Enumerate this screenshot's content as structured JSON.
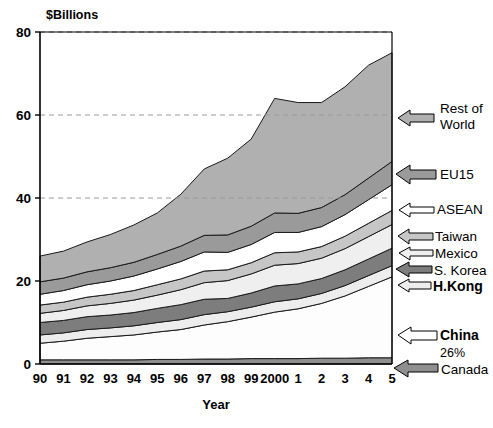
{
  "chart_data": {
    "type": "area",
    "stacked": true,
    "title": "",
    "subtitle": "",
    "unit_label": "$Billions",
    "xlabel": "Year",
    "ylabel": "",
    "ylim": [
      0,
      80
    ],
    "yticks": [
      0,
      20,
      40,
      60,
      80
    ],
    "grid": "horizontal-dashed-at-40-and-60",
    "legend_position": "right-arrow-callouts",
    "x": [
      "1990",
      "1991",
      "1992",
      "1993",
      "1994",
      "1995",
      "1996",
      "1997",
      "1998",
      "1999",
      "2000",
      "2001",
      "2002",
      "2003",
      "2004",
      "2005"
    ],
    "xtick_labels": [
      "90",
      "91",
      "92",
      "93",
      "94",
      "95",
      "96",
      "97",
      "98",
      "99",
      "2000",
      "1",
      "2",
      "3",
      "4",
      "5"
    ],
    "series": [
      {
        "name": "Canada",
        "label": "Canada",
        "color": "#8f8f8f",
        "arrow_style": "solid-gray",
        "values": [
          1.0,
          1.0,
          1.0,
          1.0,
          1.0,
          1.1,
          1.1,
          1.2,
          1.2,
          1.3,
          1.3,
          1.3,
          1.4,
          1.4,
          1.5,
          1.5
        ]
      },
      {
        "name": "China",
        "label": "China",
        "annotation": "26%",
        "color": "#fdfdfd",
        "arrow_style": "outline-white",
        "values": [
          4.0,
          4.5,
          5.2,
          5.6,
          6.0,
          6.6,
          7.2,
          8.2,
          9.0,
          10.0,
          11.2,
          12.0,
          13.2,
          15.0,
          17.2,
          19.5
        ]
      },
      {
        "name": "H.Kong",
        "label": "H.Kong",
        "color": "#ededed",
        "arrow_style": "outline-white",
        "values": [
          2.0,
          2.0,
          2.1,
          2.1,
          2.2,
          2.3,
          2.4,
          2.5,
          2.4,
          2.4,
          2.5,
          2.4,
          2.4,
          2.5,
          2.6,
          2.7
        ]
      },
      {
        "name": "S. Korea",
        "label": "S. Korea",
        "color": "#7d7d7d",
        "arrow_style": "solid-darkgray",
        "values": [
          3.0,
          3.0,
          3.1,
          3.1,
          3.2,
          3.4,
          3.6,
          3.7,
          3.2,
          3.4,
          3.8,
          3.6,
          3.6,
          3.8,
          4.0,
          4.2
        ]
      },
      {
        "name": "Mexico",
        "label": "Mexico",
        "color": "#efefef",
        "arrow_style": "outline-lightgray",
        "values": [
          2.2,
          2.4,
          2.6,
          2.8,
          3.0,
          3.2,
          3.6,
          4.0,
          4.3,
          4.6,
          5.0,
          4.9,
          4.9,
          5.1,
          5.4,
          5.7
        ]
      },
      {
        "name": "Taiwan",
        "label": "Taiwan",
        "color": "#c6c6c6",
        "arrow_style": "solid-midgray",
        "values": [
          2.0,
          2.0,
          2.1,
          2.2,
          2.3,
          2.5,
          2.6,
          2.8,
          2.6,
          2.7,
          3.0,
          2.8,
          2.8,
          3.0,
          3.2,
          3.4
        ]
      },
      {
        "name": "ASEAN",
        "label": "ASEAN",
        "color": "#ffffff",
        "arrow_style": "outline-white",
        "values": [
          2.6,
          2.8,
          3.0,
          3.2,
          3.5,
          3.8,
          4.2,
          4.6,
          4.2,
          4.4,
          4.9,
          4.7,
          4.8,
          5.2,
          5.7,
          6.2
        ]
      },
      {
        "name": "EU15",
        "label": "EU15",
        "color": "#9a9a9a",
        "arrow_style": "solid-gray",
        "values": [
          3.0,
          3.0,
          3.1,
          3.2,
          3.3,
          3.5,
          3.7,
          4.0,
          4.2,
          4.4,
          4.7,
          4.6,
          4.6,
          4.8,
          5.2,
          5.6
        ]
      },
      {
        "name": "Rest of World",
        "label": "Rest of World",
        "label_line1": "Rest of",
        "label_line2": "World",
        "color": "#b0b0b0",
        "arrow_style": "solid-gray",
        "values": [
          6.2,
          6.5,
          7.2,
          8.0,
          9.0,
          10.0,
          12.5,
          16.0,
          18.5,
          21.0,
          27.6,
          26.7,
          25.3,
          26.0,
          27.2,
          26.2
        ]
      }
    ],
    "totals": [
      26.0,
      27.2,
      29.4,
      31.2,
      33.5,
      36.4,
      40.9,
      47.0,
      49.6,
      54.2,
      64.0,
      63.0,
      62.9,
      66.8,
      72.0,
      75.0
    ]
  },
  "footnote": ""
}
